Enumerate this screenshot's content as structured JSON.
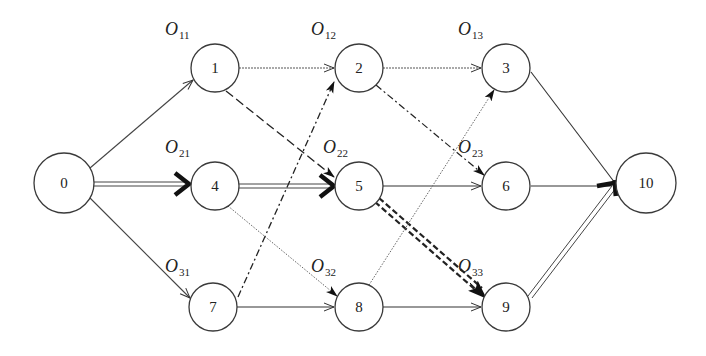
{
  "diagram": {
    "type": "directed-network",
    "nodes": [
      {
        "id": "0",
        "label": "0",
        "x": 64,
        "y": 183,
        "r": 30
      },
      {
        "id": "1",
        "label": "1",
        "x": 215,
        "y": 68,
        "r": 24
      },
      {
        "id": "2",
        "label": "2",
        "x": 359,
        "y": 68,
        "r": 24
      },
      {
        "id": "3",
        "label": "3",
        "x": 506,
        "y": 68,
        "r": 24
      },
      {
        "id": "4",
        "label": "4",
        "x": 215,
        "y": 186,
        "r": 24
      },
      {
        "id": "5",
        "label": "5",
        "x": 359,
        "y": 186,
        "r": 24
      },
      {
        "id": "6",
        "label": "6",
        "x": 506,
        "y": 186,
        "r": 24
      },
      {
        "id": "7",
        "label": "7",
        "x": 213,
        "y": 307,
        "r": 24
      },
      {
        "id": "8",
        "label": "8",
        "x": 359,
        "y": 307,
        "r": 24
      },
      {
        "id": "9",
        "label": "9",
        "x": 506,
        "y": 307,
        "r": 24
      },
      {
        "id": "10",
        "label": "10",
        "x": 646,
        "y": 183,
        "r": 30
      }
    ],
    "operation_labels": [
      {
        "base": "O",
        "sub": "11",
        "x": 165,
        "y": 36
      },
      {
        "base": "O",
        "sub": "12",
        "x": 310,
        "y": 36
      },
      {
        "base": "O",
        "sub": "13",
        "x": 458,
        "y": 36
      },
      {
        "base": "O",
        "sub": "21",
        "x": 165,
        "y": 154
      },
      {
        "base": "O",
        "sub": "22",
        "x": 322,
        "y": 154
      },
      {
        "base": "O",
        "sub": "23",
        "x": 458,
        "y": 154
      },
      {
        "base": "O",
        "sub": "31",
        "x": 165,
        "y": 272
      },
      {
        "base": "O",
        "sub": "32",
        "x": 310,
        "y": 272
      },
      {
        "base": "O",
        "sub": "33",
        "x": 458,
        "y": 272
      }
    ],
    "edges": [
      {
        "from": "0",
        "to": "1",
        "style": "thin"
      },
      {
        "from": "0",
        "to": "4",
        "style": "double-bold-arrow"
      },
      {
        "from": "0",
        "to": "7",
        "style": "thin"
      },
      {
        "from": "1",
        "to": "2",
        "style": "dotted"
      },
      {
        "from": "1",
        "to": "5",
        "style": "dash-long"
      },
      {
        "from": "4",
        "to": "5",
        "style": "double-bold-arrow"
      },
      {
        "from": "4",
        "to": "8",
        "style": "fine-dotted"
      },
      {
        "from": "7",
        "to": "2",
        "style": "dash-dot"
      },
      {
        "from": "7",
        "to": "8",
        "style": "thin"
      },
      {
        "from": "2",
        "to": "3",
        "style": "dotted"
      },
      {
        "from": "2",
        "to": "6",
        "style": "dash-dot"
      },
      {
        "from": "5",
        "to": "6",
        "style": "thin"
      },
      {
        "from": "5",
        "to": "9",
        "style": "double-dashed-bold"
      },
      {
        "from": "8",
        "to": "3",
        "style": "fine-dotted"
      },
      {
        "from": "8",
        "to": "9",
        "style": "thin"
      },
      {
        "from": "3",
        "to": "10",
        "style": "thin"
      },
      {
        "from": "6",
        "to": "10",
        "style": "thin-bold-arrow"
      },
      {
        "from": "9",
        "to": "10",
        "style": "double-bold-arrow"
      }
    ]
  },
  "text": {
    "n0": "0",
    "n1": "1",
    "n2": "2",
    "n3": "3",
    "n4": "4",
    "n5": "5",
    "n6": "6",
    "n7": "7",
    "n8": "8",
    "n9": "9",
    "n10": "10",
    "o_base": "O",
    "o11": "11",
    "o12": "12",
    "o13": "13",
    "o21": "21",
    "o22": "22",
    "o23": "23",
    "o31": "31",
    "o32": "32",
    "o33": "33"
  }
}
